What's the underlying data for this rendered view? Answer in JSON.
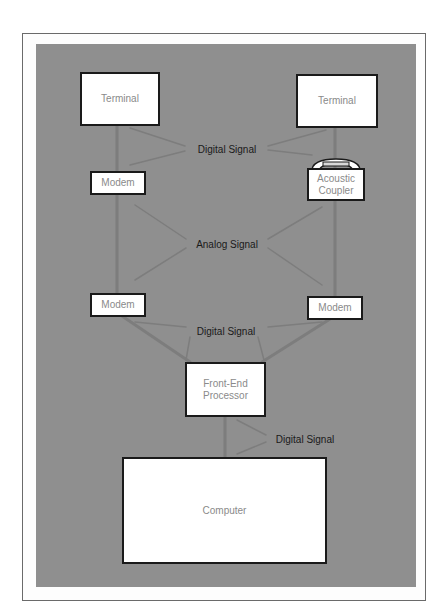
{
  "diagram": {
    "nodes": {
      "terminal_left": "Terminal",
      "terminal_right": "Terminal",
      "modem_left_top": "Modem",
      "acoustic_coupler": "Acoustic Coupler",
      "modem_left_bottom": "Modem",
      "modem_right_bottom": "Modem",
      "front_end_processor": "Front-End Processor",
      "computer": "Computer"
    },
    "labels": {
      "digital_signal_top": "Digital Signal",
      "analog_signal": "Analog Signal",
      "digital_signal_middle": "Digital Signal",
      "digital_signal_bottom": "Digital Signal"
    },
    "colors": {
      "panel": "#8f8f8f",
      "wire": "#7c7c7c",
      "box_border": "#1a1a1a",
      "box_text": "#8a8a8a"
    }
  }
}
